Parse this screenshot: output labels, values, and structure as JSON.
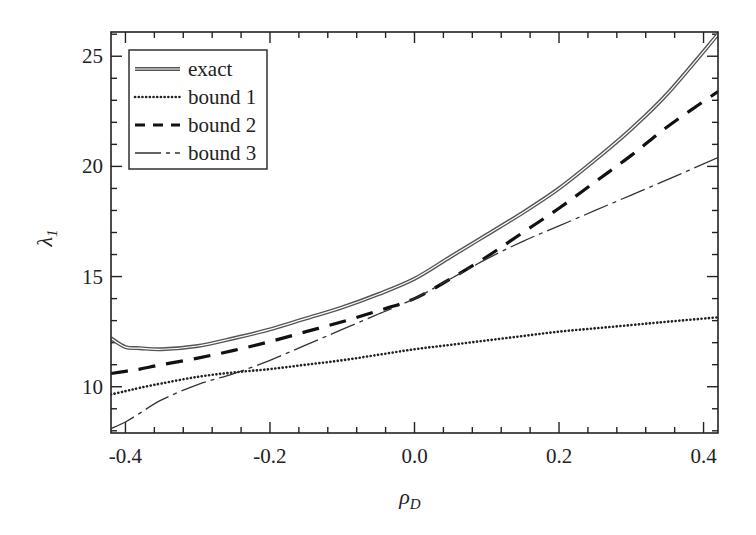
{
  "chart_data": {
    "type": "line",
    "title": "",
    "xlabel": "ρ_D",
    "ylabel": "λ_1",
    "xlabel_main": "ρ",
    "xlabel_sub": "D",
    "ylabel_main": "λ",
    "ylabel_sub": "1",
    "xlim": [
      -0.42,
      0.42
    ],
    "ylim": [
      7.9,
      26.1
    ],
    "x_ticks": [
      -0.4,
      -0.2,
      0.0,
      0.2,
      0.4
    ],
    "x_tick_labels": [
      "-0.4",
      "-0.2",
      "0.0",
      "0.2",
      "0.4"
    ],
    "x_minor_step": 0.04,
    "y_ticks": [
      10,
      15,
      20,
      25
    ],
    "y_tick_labels": [
      "10",
      "15",
      "20",
      "25"
    ],
    "y_minor_step": 1,
    "grid": false,
    "legend_position": "upper left",
    "x": [
      -0.42,
      -0.4,
      -0.38,
      -0.35,
      -0.3,
      -0.25,
      -0.2,
      -0.15,
      -0.1,
      -0.05,
      0.0,
      0.05,
      0.1,
      0.15,
      0.2,
      0.25,
      0.3,
      0.35,
      0.42
    ],
    "series": [
      {
        "name": "exact",
        "style": "double-solid",
        "values": [
          12.2,
          11.8,
          11.75,
          11.7,
          11.85,
          12.2,
          12.6,
          13.1,
          13.6,
          14.2,
          14.9,
          15.9,
          16.9,
          17.9,
          19.0,
          20.3,
          21.7,
          23.3,
          26.0
        ]
      },
      {
        "name": "bound 1",
        "style": "dotted",
        "values": [
          9.65,
          9.8,
          9.95,
          10.15,
          10.45,
          10.65,
          10.8,
          11.0,
          11.2,
          11.45,
          11.7,
          11.9,
          12.1,
          12.3,
          12.5,
          12.65,
          12.8,
          12.95,
          13.15
        ]
      },
      {
        "name": "bound 2",
        "style": "dashed",
        "values": [
          10.6,
          10.7,
          10.8,
          11.0,
          11.3,
          11.65,
          12.05,
          12.5,
          12.95,
          13.45,
          14.0,
          14.9,
          15.9,
          17.0,
          18.1,
          19.3,
          20.5,
          21.8,
          23.4
        ]
      },
      {
        "name": "bound 3",
        "style": "dash-dot",
        "values": [
          8.1,
          8.4,
          8.8,
          9.4,
          10.1,
          10.6,
          11.2,
          11.9,
          12.6,
          13.3,
          14.0,
          14.9,
          15.8,
          16.6,
          17.3,
          18.0,
          18.7,
          19.4,
          20.4
        ]
      }
    ]
  }
}
